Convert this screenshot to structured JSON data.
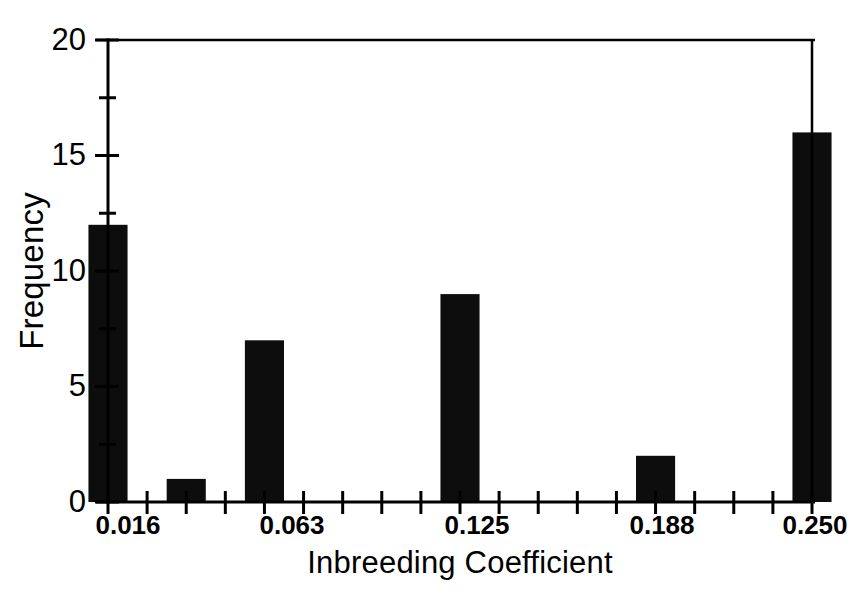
{
  "chart_data": {
    "type": "bar",
    "title": "",
    "subtitle": "",
    "xlabel": "Inbreeding Coefficient",
    "ylabel": "Frequency",
    "xlim": [
      0.0101,
      0.2606
    ],
    "ylim": [
      0,
      20
    ],
    "grid": false,
    "legend": null,
    "bar_color": "#0d0d0d",
    "background_color": "#ffffff",
    "axis_color": "#000000",
    "bin_width": 0.01176,
    "y_ticks_major": [
      0,
      5,
      10,
      15,
      20
    ],
    "y_ticks_minor": [
      2.5,
      7.5,
      12.5,
      17.5
    ],
    "y_tick_labels": [
      "0",
      "5",
      "10",
      "15",
      "20"
    ],
    "x_ticks_labeled": [
      0.016,
      0.063,
      0.125,
      0.188,
      0.25
    ],
    "x_tick_labels": [
      "0.016",
      "0.063",
      "0.125",
      "0.188",
      "0.250"
    ],
    "x_tick_count": 19,
    "categories": [
      "0.016",
      "0.028",
      "0.039",
      "0.051",
      "0.063",
      "0.075",
      "0.086",
      "0.098",
      "0.110",
      "0.125",
      "0.137",
      "0.149",
      "0.161",
      "0.172",
      "0.188",
      "0.200",
      "0.212",
      "0.224",
      "0.250"
    ],
    "values": [
      12,
      0,
      1,
      0,
      7,
      0,
      0,
      0,
      0,
      9,
      0,
      0,
      0,
      0,
      2,
      0,
      0,
      0,
      16
    ],
    "bars": [
      {
        "x": 0.016,
        "value": 12,
        "label": "0.016"
      },
      {
        "x": 0.039,
        "value": 1,
        "label": "0.039"
      },
      {
        "x": 0.063,
        "value": 7,
        "label": "0.063"
      },
      {
        "x": 0.125,
        "value": 9,
        "label": "0.125"
      },
      {
        "x": 0.188,
        "value": 2,
        "label": "0.188"
      },
      {
        "x": 0.25,
        "value": 16,
        "label": "0.250"
      }
    ]
  },
  "axes": {
    "y_title": "Frequency",
    "x_title": "Inbreeding Coefficient",
    "y_labels": [
      "20",
      "15",
      "10",
      "5",
      "0"
    ],
    "x_labels": [
      "0.016",
      "0.063",
      "0.125",
      "0.188",
      "0.250"
    ]
  }
}
